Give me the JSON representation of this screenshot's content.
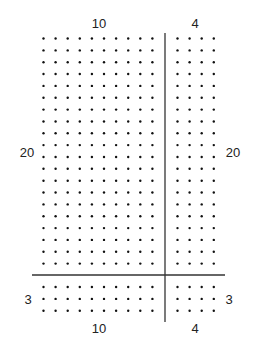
{
  "diagram": {
    "type": "dot-array-area-model",
    "regions": [
      {
        "name": "top-left",
        "rows": 20,
        "cols": 10
      },
      {
        "name": "top-right",
        "rows": 20,
        "cols": 4
      },
      {
        "name": "bottom-left",
        "rows": 3,
        "cols": 10
      },
      {
        "name": "bottom-right",
        "rows": 3,
        "cols": 4
      }
    ],
    "labels": {
      "top_left_cols": "10",
      "top_right_cols": "4",
      "left_top_rows": "20",
      "right_top_rows": "20",
      "left_bottom_rows": "3",
      "right_bottom_rows": "3",
      "bottom_left_cols": "10",
      "bottom_right_cols": "4"
    },
    "colors": {
      "dot": "#111111",
      "line": "#333333",
      "text": "#222222"
    }
  }
}
